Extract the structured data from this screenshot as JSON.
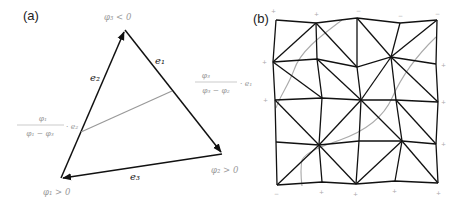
{
  "panels": [
    {
      "label": "(a)",
      "vertices": [
        {
          "id": "v3",
          "label": "φ₃ < 0",
          "x": 125,
          "y": 30
        },
        {
          "id": "v2",
          "label": "φ₂ > 0",
          "x": 222,
          "y": 154
        },
        {
          "id": "v1",
          "label": "φ₁ > 0",
          "x": 61,
          "y": 178
        }
      ],
      "edges": [
        {
          "label": "e₁",
          "from": "v3",
          "to": "v2"
        },
        {
          "label": "e₂",
          "from": "v1",
          "to": "v3"
        },
        {
          "label": "e₃",
          "from": "v2",
          "to": "v1"
        }
      ],
      "annotations": {
        "right_frac_num": "φ₃",
        "right_frac_den": "φ₃ − φ₂",
        "right_frac_suffix": "· e₁",
        "left_frac_num": "φ₁",
        "left_frac_den": "φ₁ − φ₃",
        "left_frac_suffix": "· e₂"
      },
      "vertex_labels": {
        "top": "φ₃ < 0",
        "right": "φ₂ > 0",
        "left": "φ₁ > 0"
      },
      "edge_labels": {
        "e1": "e₁",
        "e2": "e₂",
        "e3": "e₃"
      }
    },
    {
      "label": "(b)",
      "description": "Perturbed 5x5 grid triangulated mesh with gray zero-level-set curves",
      "grid_nodes": [
        [
          [
            276,
            20
          ],
          [
            316,
            23
          ],
          [
            357,
            18
          ],
          [
            400,
            23
          ],
          [
            437,
            20
          ]
        ],
        [
          [
            273,
            62
          ],
          [
            317,
            59
          ],
          [
            357,
            67
          ],
          [
            391,
            57
          ],
          [
            436,
            64
          ]
        ],
        [
          [
            275,
            100
          ],
          [
            322,
            98
          ],
          [
            361,
            100
          ],
          [
            396,
            100
          ],
          [
            438,
            102
          ]
        ],
        [
          [
            276,
            142
          ],
          [
            319,
            145
          ],
          [
            359,
            141
          ],
          [
            402,
            141
          ],
          [
            436,
            144
          ]
        ],
        [
          [
            277,
            185
          ],
          [
            322,
            182
          ],
          [
            356,
            184
          ],
          [
            395,
            181
          ],
          [
            438,
            183
          ]
        ]
      ],
      "curves": [
        "upper-left arc from top edge to left edge",
        "upper-right arc from right edge down through middle",
        "lower-left arc from middle-top to bottom edge"
      ],
      "signs": {
        "top": [
          "+",
          "+",
          "−",
          "−",
          "−"
        ],
        "bottom": [
          "−",
          "+",
          "+",
          "+",
          "+"
        ]
      }
    }
  ]
}
